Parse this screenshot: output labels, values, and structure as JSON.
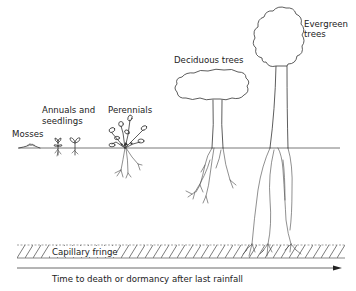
{
  "diagram": {
    "labels": {
      "mosses": "Mosses",
      "annuals_line1": "Annuals and",
      "annuals_line2": "seedlings",
      "perennials": "Perennials",
      "deciduous": "Deciduous trees",
      "evergreen_line1": "Evergreen",
      "evergreen_line2": "trees",
      "capillary_fringe": "Capillary fringe",
      "time_axis": "Time to death or dormancy after last rainfall"
    },
    "colors": {
      "ink": "#333333",
      "background": "#ffffff"
    }
  }
}
